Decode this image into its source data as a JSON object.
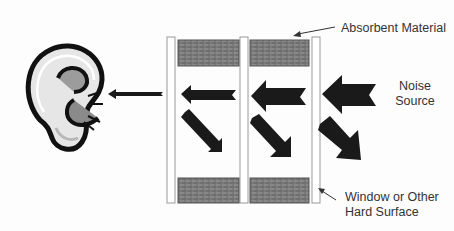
{
  "diagram": {
    "type": "acoustic-noise-transmission",
    "colors": {
      "background": "#fdfdfd",
      "arrow": "#1a1a1a",
      "panel_fill": "#ffffff",
      "panel_stroke": "#9a9a9a",
      "absorbent_fill": "#7a7a7a",
      "absorbent_stroke": "#555555",
      "text": "#333333"
    },
    "labels": {
      "absorbent": "Absorbent Material",
      "noise_line1": "Noise",
      "noise_line2": "Source",
      "window_line1": "Window or Other",
      "window_line2": "Hard Surface"
    },
    "icons": {
      "ear": "ear-icon",
      "transmitted_arrow": "arrow-left-icon",
      "reflected_arrow": "arrow-down-right-icon"
    },
    "panels": [
      {
        "name": "window-panel-1",
        "x": 167,
        "y": 37,
        "w": 8,
        "h": 166
      },
      {
        "name": "window-panel-2",
        "x": 240,
        "y": 37,
        "w": 8,
        "h": 166
      },
      {
        "name": "window-panel-3",
        "x": 312,
        "y": 37,
        "w": 8,
        "h": 166
      }
    ],
    "absorbent_blocks": [
      {
        "name": "absorbent-top-1",
        "x": 178,
        "y": 40,
        "w": 61,
        "h": 26
      },
      {
        "name": "absorbent-top-2",
        "x": 250,
        "y": 40,
        "w": 59,
        "h": 26
      },
      {
        "name": "absorbent-bottom-1",
        "x": 178,
        "y": 178,
        "w": 61,
        "h": 25
      },
      {
        "name": "absorbent-bottom-2",
        "x": 250,
        "y": 178,
        "w": 59,
        "h": 25
      }
    ],
    "flow": [
      {
        "stage": "source",
        "arrow": "large"
      },
      {
        "stage": "after-panel-3",
        "arrow": "medium"
      },
      {
        "stage": "after-panel-2",
        "arrow": "small"
      },
      {
        "stage": "to-ear",
        "arrow": "thin"
      }
    ]
  }
}
